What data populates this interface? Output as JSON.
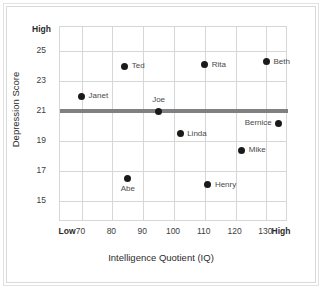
{
  "chart_data": {
    "type": "scatter",
    "title": "",
    "xlabel": "Intelligence Quotient (IQ)",
    "ylabel": "Depression Score",
    "xlim": [
      63,
      137
    ],
    "ylim": [
      13.6,
      26.6
    ],
    "grid": true,
    "legend": "none",
    "x_ticks": [
      70,
      80,
      90,
      100,
      110,
      120,
      130
    ],
    "x_tick_labels": [
      "70",
      "80",
      "90",
      "100",
      "110",
      "120",
      "130"
    ],
    "x_end_labels": {
      "low": "Low",
      "high": "High"
    },
    "y_ticks": [
      15,
      17,
      19,
      21,
      23,
      25
    ],
    "y_tick_labels": [
      "15",
      "17",
      "19",
      "21",
      "23",
      "25"
    ],
    "y_end_labels": {
      "high": "High"
    },
    "reference_line": {
      "value": 21,
      "orientation": "horizontal",
      "color": "#808080"
    },
    "point_color": "#1a1a1a",
    "points": [
      {
        "name": "Janet",
        "x": 70,
        "y": 22.0,
        "label_pos": "right"
      },
      {
        "name": "Ted",
        "x": 84,
        "y": 24.0,
        "label_pos": "right"
      },
      {
        "name": "Abe",
        "x": 85,
        "y": 16.5,
        "label_pos": "below"
      },
      {
        "name": "Joe",
        "x": 95,
        "y": 21.0,
        "label_pos": "above"
      },
      {
        "name": "Linda",
        "x": 102,
        "y": 19.5,
        "label_pos": "right"
      },
      {
        "name": "Rita",
        "x": 110,
        "y": 24.1,
        "label_pos": "right"
      },
      {
        "name": "Henry",
        "x": 111,
        "y": 16.1,
        "label_pos": "right"
      },
      {
        "name": "Mike",
        "x": 122,
        "y": 18.4,
        "label_pos": "right"
      },
      {
        "name": "Beth",
        "x": 130,
        "y": 24.3,
        "label_pos": "right"
      },
      {
        "name": "Bernice",
        "x": 134,
        "y": 20.2,
        "label_pos": "left"
      }
    ]
  }
}
